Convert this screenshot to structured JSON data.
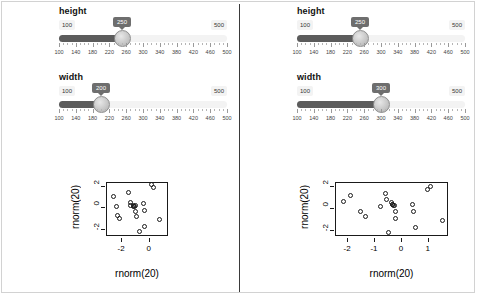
{
  "panels": [
    {
      "id": "left",
      "sliders": [
        {
          "label": "height",
          "value": "250",
          "min_label": "100",
          "max_label": "500",
          "min": 100,
          "max": 500,
          "value_num": 250,
          "ticks": [
            "100",
            "140",
            "180",
            "220",
            "260",
            "300",
            "340",
            "380",
            "420",
            "460",
            "500"
          ]
        },
        {
          "label": "width",
          "value": "200",
          "min_label": "100",
          "max_label": "500",
          "min": 100,
          "max": 500,
          "value_num": 200,
          "ticks": [
            "100",
            "140",
            "180",
            "220",
            "260",
            "300",
            "340",
            "380",
            "420",
            "460",
            "500"
          ]
        }
      ],
      "chart_data": {
        "type": "scatter",
        "title": "",
        "xlabel": "rnorm(20)",
        "ylabel": "rnorm(20)",
        "xticks": [
          "-2",
          "0"
        ],
        "xtick_values": [
          -2,
          0
        ],
        "yticks": [
          "-2",
          "0",
          "2"
        ],
        "ytick_values": [
          -2,
          0,
          2
        ],
        "xlim": [
          -3.1,
          1.4
        ],
        "ylim": [
          -2.7,
          2.35
        ],
        "grid": false,
        "legend": "none",
        "points": [
          [
            -2.55,
            0.95
          ],
          [
            -2.3,
            0.05
          ],
          [
            -2.2,
            -0.85
          ],
          [
            -2.1,
            -1.15
          ],
          [
            -1.45,
            1.3
          ],
          [
            -1.3,
            0.35
          ],
          [
            -1.25,
            0.15
          ],
          [
            -1.1,
            0.1
          ],
          [
            -1.05,
            0.05
          ],
          [
            -1.0,
            0.0
          ],
          [
            -0.95,
            0.15
          ],
          [
            -0.9,
            -0.45
          ],
          [
            -0.85,
            -0.95
          ],
          [
            -0.6,
            -2.35
          ],
          [
            -0.35,
            0.3
          ],
          [
            -0.3,
            -0.35
          ],
          [
            -0.25,
            -1.9
          ],
          [
            0.25,
            2.05
          ],
          [
            0.35,
            1.8
          ],
          [
            0.8,
            -1.25
          ]
        ]
      }
    },
    {
      "id": "right",
      "sliders": [
        {
          "label": "height",
          "value": "250",
          "min_label": "100",
          "max_label": "500",
          "min": 100,
          "max": 500,
          "value_num": 250,
          "ticks": [
            "100",
            "140",
            "180",
            "220",
            "260",
            "300",
            "340",
            "380",
            "420",
            "460",
            "500"
          ]
        },
        {
          "label": "width",
          "value": "300",
          "min_label": "100",
          "max_label": "500",
          "min": 100,
          "max": 500,
          "value_num": 300,
          "ticks": [
            "100",
            "140",
            "180",
            "220",
            "260",
            "300",
            "340",
            "380",
            "420",
            "460",
            "500"
          ]
        }
      ],
      "chart_data": {
        "type": "scatter",
        "title": "",
        "xlabel": "rnorm(20)",
        "ylabel": "rnorm(20)",
        "xticks": [
          "-2",
          "-1",
          "0",
          "1"
        ],
        "xtick_values": [
          -2,
          -1,
          0,
          1
        ],
        "yticks": [
          "-2",
          "0",
          "2"
        ],
        "ytick_values": [
          -2,
          0,
          2
        ],
        "xlim": [
          -2.45,
          1.75
        ],
        "ylim": [
          -2.55,
          2.35
        ],
        "grid": false,
        "legend": "none",
        "points": [
          [
            -2.1,
            0.55
          ],
          [
            -1.85,
            1.05
          ],
          [
            -1.5,
            -0.35
          ],
          [
            -1.3,
            -0.85
          ],
          [
            -0.75,
            0.05
          ],
          [
            -0.55,
            1.25
          ],
          [
            -0.5,
            0.75
          ],
          [
            -0.45,
            -2.25
          ],
          [
            -0.35,
            0.45
          ],
          [
            -0.3,
            0.3
          ],
          [
            -0.28,
            0.25
          ],
          [
            -0.25,
            0.2
          ],
          [
            -0.22,
            0.15
          ],
          [
            -0.2,
            -0.35
          ],
          [
            -0.18,
            -1.05
          ],
          [
            0.45,
            0.25
          ],
          [
            0.5,
            -0.35
          ],
          [
            0.55,
            -1.85
          ],
          [
            1.0,
            1.65
          ],
          [
            1.1,
            1.9
          ],
          [
            1.55,
            -1.2
          ]
        ]
      }
    }
  ]
}
